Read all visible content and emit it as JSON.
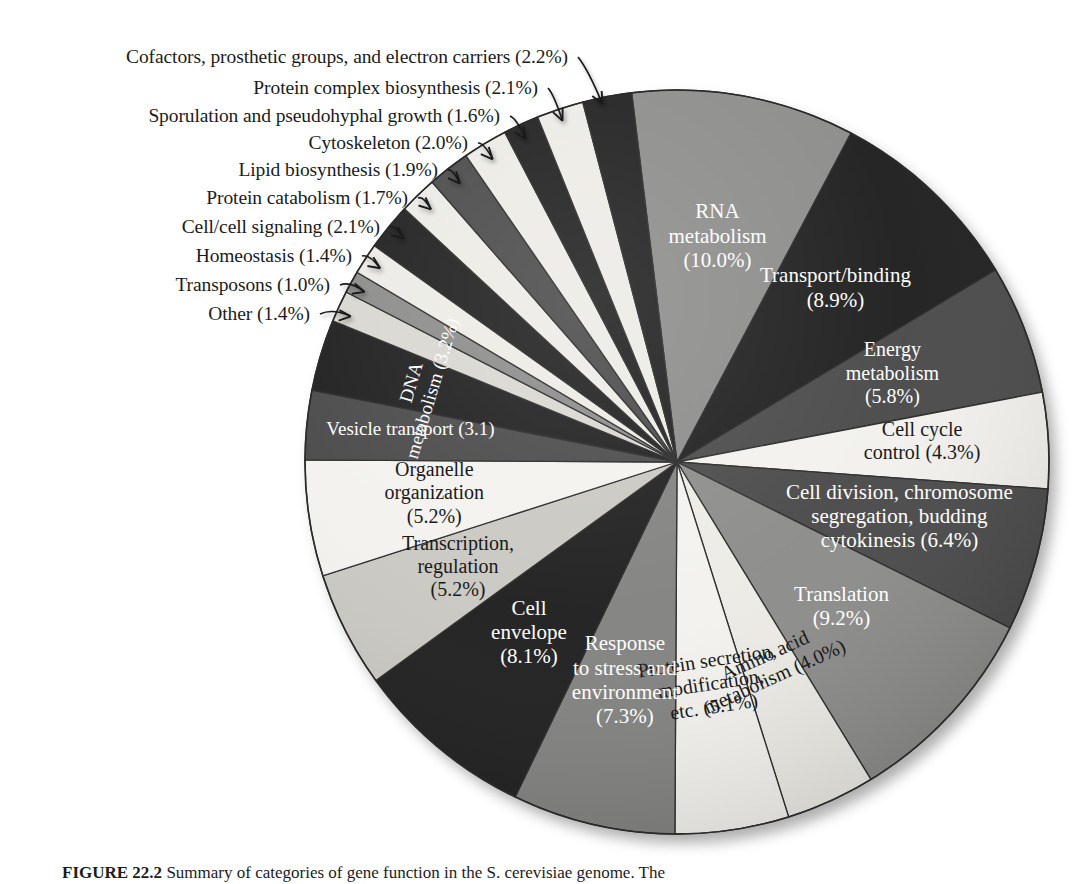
{
  "figure": {
    "caption_label": "FIGURE 22.2",
    "caption_text": "Summary of categories of gene function in the S. cerevisiae genome. The"
  },
  "chart_data": {
    "type": "pie",
    "title": "Summary of categories of gene function in the S. cerevisiae genome",
    "units": "percent",
    "legend_position": "none",
    "labels_on_slices": true,
    "start_angle_deg": -7,
    "direction": "clockwise",
    "center": {
      "x": 677,
      "y": 462
    },
    "radius": 372,
    "categories": [
      "RNA metabolism",
      "Transport/binding",
      "Energy metabolism",
      "Cell cycle control",
      "Cell division, chromosome segregation, budding cytokinesis",
      "Translation",
      "Amino acid metabolism",
      "Protein secretion, modification, etc.",
      "Response to stress and environment",
      "Cell envelope",
      "Transcription, regulation",
      "Organelle organization",
      "Vesicle transport",
      "DNA metabolism",
      "Other",
      "Transposons",
      "Homeostasis",
      "Cell/cell signaling",
      "Protein catabolism",
      "Lipid biosynthesis",
      "Cytoskeleton",
      "Sporulation and pseudohyphal growth",
      "Protein complex biosynthesis",
      "Cofactors, prosthetic groups, and electron carriers"
    ],
    "values": [
      10.0,
      8.9,
      5.8,
      4.3,
      6.4,
      9.2,
      4.0,
      5.1,
      7.3,
      8.1,
      5.2,
      5.2,
      3.1,
      3.2,
      1.4,
      1.0,
      1.4,
      2.1,
      1.7,
      1.9,
      2.0,
      1.6,
      2.1,
      2.2
    ],
    "colors": [
      "#8c8c8a",
      "#1f1f1f",
      "#4a4a4a",
      "#f2f1ed",
      "#4a4a4a",
      "#8c8c8a",
      "#ecebe6",
      "#f3f2ee",
      "#828280",
      "#1f1f1f",
      "#c9c8c2",
      "#f3f2ee",
      "#4a4a4a",
      "#1f1f1f",
      "#d8d7d1",
      "#8c8c8a",
      "#ecebe6",
      "#1f1f1f",
      "#ecebe6",
      "#4a4a4a",
      "#ecebe6",
      "#1f1f1f",
      "#ecebe6",
      "#1f1f1f"
    ],
    "slices": [
      {
        "label": "RNA metabolism",
        "value": 10.0,
        "display": "RNA\nmetabolism\n(10.0%)",
        "color": "#8c8c8a",
        "text_color": "#ffffff",
        "placement": "inside"
      },
      {
        "label": "Transport/binding",
        "value": 8.9,
        "display": "Transport/binding\n(8.9%)",
        "color": "#1f1f1f",
        "text_color": "#ffffff",
        "placement": "inside"
      },
      {
        "label": "Energy metabolism",
        "value": 5.8,
        "display": "Energy\nmetabolism\n(5.8%)",
        "color": "#4a4a4a",
        "text_color": "#ffffff",
        "placement": "inside"
      },
      {
        "label": "Cell cycle control",
        "value": 4.3,
        "display": "Cell cycle\ncontrol (4.3%)",
        "color": "#f2f1ed",
        "text_color": "#1a1a1a",
        "placement": "inside"
      },
      {
        "label": "Cell division, chromosome segregation, budding cytokinesis",
        "value": 6.4,
        "display": "Cell division, chromosome\nsegregation, budding\ncytokinesis (6.4%)",
        "color": "#4a4a4a",
        "text_color": "#ffffff",
        "placement": "inside"
      },
      {
        "label": "Translation",
        "value": 9.2,
        "display": "Translation\n(9.2%)",
        "color": "#8c8c8a",
        "text_color": "#ffffff",
        "placement": "inside"
      },
      {
        "label": "Amino acid metabolism",
        "value": 4.0,
        "display": "Amino acid\nmetabolism (4.0%)",
        "color": "#ecebe6",
        "text_color": "#1a1a1a",
        "placement": "inside-rotated"
      },
      {
        "label": "Protein secretion, modification, etc.",
        "value": 5.1,
        "display": "Protein secretion,\nmodification,\netc. (5.1%)",
        "color": "#f3f2ee",
        "text_color": "#1a1a1a",
        "placement": "inside-rotated"
      },
      {
        "label": "Response to stress and environment",
        "value": 7.3,
        "display": "Response\nto stress and\nenvironment\n(7.3%)",
        "color": "#828280",
        "text_color": "#ffffff",
        "placement": "inside"
      },
      {
        "label": "Cell envelope",
        "value": 8.1,
        "display": "Cell\nenvelope\n(8.1%)",
        "color": "#1f1f1f",
        "text_color": "#ffffff",
        "placement": "inside"
      },
      {
        "label": "Transcription, regulation",
        "value": 5.2,
        "display": "Transcription,\nregulation\n(5.2%)",
        "color": "#c9c8c2",
        "text_color": "#1a1a1a",
        "placement": "inside"
      },
      {
        "label": "Organelle organization",
        "value": 5.2,
        "display": "Organelle\norganization\n(5.2%)",
        "color": "#f3f2ee",
        "text_color": "#1a1a1a",
        "placement": "inside"
      },
      {
        "label": "Vesicle transport",
        "value": 3.1,
        "display": "Vesicle transport (3.1)",
        "color": "#4a4a4a",
        "text_color": "#ffffff",
        "placement": "inside"
      },
      {
        "label": "DNA metabolism",
        "value": 3.2,
        "display": "DNA\nmetabolism (3.2%)",
        "color": "#1f1f1f",
        "text_color": "#ffffff",
        "placement": "inside-rotated"
      },
      {
        "label": "Other",
        "value": 1.4,
        "display": "Other (1.4%)",
        "color": "#d8d7d1",
        "text_color": "#1a1a1a",
        "placement": "callout"
      },
      {
        "label": "Transposons",
        "value": 1.0,
        "display": "Transposons (1.0%)",
        "color": "#8c8c8a",
        "text_color": "#1a1a1a",
        "placement": "callout"
      },
      {
        "label": "Homeostasis",
        "value": 1.4,
        "display": "Homeostasis (1.4%)",
        "color": "#ecebe6",
        "text_color": "#1a1a1a",
        "placement": "callout"
      },
      {
        "label": "Cell/cell signaling",
        "value": 2.1,
        "display": "Cell/cell signaling (2.1%)",
        "color": "#1f1f1f",
        "text_color": "#1a1a1a",
        "placement": "callout"
      },
      {
        "label": "Protein catabolism",
        "value": 1.7,
        "display": "Protein catabolism (1.7%)",
        "color": "#ecebe6",
        "text_color": "#1a1a1a",
        "placement": "callout"
      },
      {
        "label": "Lipid biosynthesis",
        "value": 1.9,
        "display": "Lipid biosynthesis (1.9%)",
        "color": "#4a4a4a",
        "text_color": "#1a1a1a",
        "placement": "callout"
      },
      {
        "label": "Cytoskeleton",
        "value": 2.0,
        "display": "Cytoskeleton (2.0%)",
        "color": "#ecebe6",
        "text_color": "#1a1a1a",
        "placement": "callout"
      },
      {
        "label": "Sporulation and pseudohyphal growth",
        "value": 1.6,
        "display": "Sporulation and pseudohyphal growth (1.6%)",
        "color": "#1f1f1f",
        "text_color": "#1a1a1a",
        "placement": "callout"
      },
      {
        "label": "Protein complex biosynthesis",
        "value": 2.1,
        "display": "Protein complex biosynthesis (2.1%)",
        "color": "#ecebe6",
        "text_color": "#1a1a1a",
        "placement": "callout"
      },
      {
        "label": "Cofactors, prosthetic groups, and electron carriers",
        "value": 2.2,
        "display": "Cofactors, prosthetic groups, and electron carriers (2.2%)",
        "color": "#1f1f1f",
        "text_color": "#1a1a1a",
        "placement": "callout"
      }
    ]
  },
  "callouts": [
    {
      "text": "Cofactors, prosthetic groups, and electron carriers (2.2%)",
      "right": 568,
      "top": 57
    },
    {
      "text": "Protein complex biosynthesis (2.1%)",
      "right": 538,
      "top": 88
    },
    {
      "text": "Sporulation and pseudohyphal growth (1.6%)",
      "right": 500,
      "top": 116
    },
    {
      "text": "Cytoskeleton (2.0%)",
      "right": 468,
      "top": 143
    },
    {
      "text": "Lipid biosynthesis (1.9%)",
      "right": 438,
      "top": 170
    },
    {
      "text": "Protein catabolism (1.7%)",
      "right": 408,
      "top": 198
    },
    {
      "text": "Cell/cell signaling (2.1%)",
      "right": 380,
      "top": 227
    },
    {
      "text": "Homeostasis (1.4%)",
      "right": 352,
      "top": 256
    },
    {
      "text": "Transposons (1.0%)",
      "right": 330,
      "top": 285
    },
    {
      "text": "Other (1.4%)",
      "right": 310,
      "top": 314
    }
  ]
}
